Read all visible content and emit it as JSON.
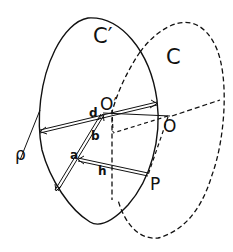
{
  "diagram": {
    "labels": {
      "circle_front": "C′",
      "circle_back": "C",
      "center_front": "O′",
      "center_back": "O",
      "point": "P",
      "radius": "ρ",
      "seg_a": "a",
      "seg_b": "b",
      "seg_d": "d",
      "seg_h": "h"
    },
    "colors": {
      "stroke": "#111111",
      "background": "#ffffff"
    }
  }
}
